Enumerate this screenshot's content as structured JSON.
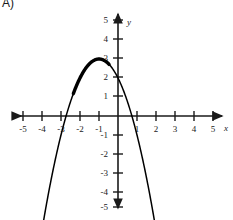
{
  "problem": {
    "label": "A)"
  },
  "axes": {
    "x_name": "x",
    "y_name": "y",
    "x_tick_labels": [
      "-5",
      "-4",
      "-3",
      "-2",
      "-1",
      "1",
      "2",
      "3",
      "4",
      "5"
    ],
    "y_tick_labels": [
      "5",
      "4",
      "3",
      "2",
      "1",
      "-1",
      "-2",
      "-3",
      "-4",
      "-5"
    ],
    "origin_label": "",
    "arrows": [
      "left",
      "right",
      "up",
      "down"
    ]
  },
  "chart_data": {
    "type": "line",
    "title": "",
    "xlabel": "x",
    "ylabel": "y",
    "xlim": [
      -5,
      5
    ],
    "ylim": [
      -5,
      5
    ],
    "grid": false,
    "legend": "none",
    "xticks": [
      -5,
      -4,
      -3,
      -2,
      -1,
      1,
      2,
      3,
      4,
      5
    ],
    "yticks": [
      5,
      4,
      3,
      2,
      1,
      -1,
      -2,
      -3,
      -4,
      -5
    ],
    "series": [
      {
        "name": "parabola",
        "equation": "y = -(x + 1)^2 + 3",
        "vertex": [
          -1,
          3
        ],
        "opens": "down",
        "y_intercept": 2,
        "x_intercepts": [
          -2.73,
          0.73
        ],
        "color": "#000000",
        "x": [
          -4.0,
          -3.8,
          -3.6,
          -3.4,
          -3.2,
          -3.0,
          -2.8,
          -2.6,
          -2.4,
          -2.2,
          -2.0,
          -1.8,
          -1.6,
          -1.4,
          -1.2,
          -1.0,
          -0.8,
          -0.6,
          -0.4,
          -0.2,
          0.0,
          0.2,
          0.4,
          0.6,
          0.8,
          1.0,
          1.2,
          1.4,
          1.6,
          1.8,
          2.0
        ],
        "y": [
          -6.0,
          -4.84,
          -3.76,
          -2.76,
          -1.84,
          -1.0,
          -0.24,
          0.44,
          1.04,
          1.56,
          2.0,
          2.36,
          2.64,
          2.84,
          2.96,
          3.0,
          2.96,
          2.84,
          2.64,
          2.36,
          2.0,
          1.56,
          1.04,
          0.44,
          -0.24,
          -1.0,
          -1.84,
          -2.76,
          -3.76,
          -4.84,
          -6.0
        ]
      }
    ]
  }
}
